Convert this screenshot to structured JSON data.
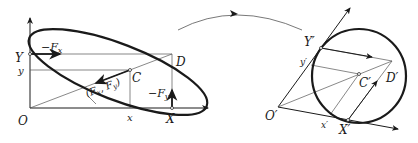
{
  "left_figure": {
    "labels": {
      "origin": "O",
      "y_axis_point": "Y",
      "y_coord": "y",
      "x_coord": "x",
      "x_axis_point": "X",
      "corner": "D",
      "point_c": "C",
      "force_neg_fx": "−F",
      "force_neg_fx_sub": "x",
      "force_neg_fy": "−F",
      "force_neg_fy_sub": "y",
      "force_vec_open": "(F",
      "force_vec_sub_x": "x",
      "force_vec_mid": ", F",
      "force_vec_sub_y": "y",
      "force_vec_close": ")"
    }
  },
  "right_figure": {
    "labels": {
      "origin": "O′",
      "y_axis_point": "Y′",
      "y_coord": "y′",
      "x_coord": "x′",
      "x_axis_point": "X′",
      "corner": "D′",
      "point_c": "C′"
    }
  },
  "colors": {
    "stroke": "#1a1a1a",
    "thin": "#555555"
  }
}
